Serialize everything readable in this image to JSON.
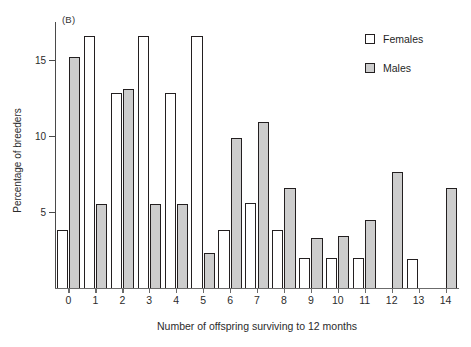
{
  "panel": {
    "label": "(B)"
  },
  "legend": {
    "position": "top-right",
    "entries": [
      {
        "name": "Females",
        "swatch": "open-square",
        "color": "#ffffff"
      },
      {
        "name": "Males",
        "swatch": "filled-square",
        "color": "#cdcdcd"
      }
    ]
  },
  "axes": {
    "y": {
      "title": "Percentage of breeders",
      "ticks": [
        5,
        10,
        15
      ],
      "tick_labels": [
        "5",
        "10",
        "15"
      ],
      "min": 0,
      "max": 17.5
    },
    "x": {
      "title": "Number of offspring surviving to 12 months",
      "tick_labels": [
        "0",
        "1",
        "2",
        "3",
        "4",
        "5",
        "6",
        "7",
        "8",
        "9",
        "10",
        "11",
        "12",
        "13",
        "14"
      ]
    }
  },
  "chart_data": {
    "type": "bar",
    "title": "(B)",
    "xlabel": "Number of offspring surviving to 12 months",
    "ylabel": "Percentage of breeders",
    "categories": [
      "0",
      "1",
      "2",
      "3",
      "4",
      "5",
      "6",
      "7",
      "8",
      "9",
      "10",
      "11",
      "12",
      "13",
      "14"
    ],
    "ylim": [
      0,
      17.5
    ],
    "yticks": [
      5,
      10,
      15
    ],
    "grid": false,
    "legend_position": "top-right",
    "series": [
      {
        "name": "Females",
        "color": "#ffffff",
        "edge_color": "#231f20",
        "values": [
          3.8,
          16.6,
          12.8,
          16.6,
          12.8,
          16.6,
          3.8,
          5.6,
          3.8,
          2.0,
          2.0,
          2.0,
          0,
          1.9,
          0
        ]
      },
      {
        "name": "Males",
        "color": "#cdcdcd",
        "edge_color": "#231f20",
        "values": [
          15.2,
          5.5,
          13.1,
          5.5,
          5.5,
          2.3,
          9.9,
          10.9,
          6.6,
          3.3,
          3.4,
          4.5,
          7.6,
          0,
          6.6
        ]
      }
    ]
  }
}
